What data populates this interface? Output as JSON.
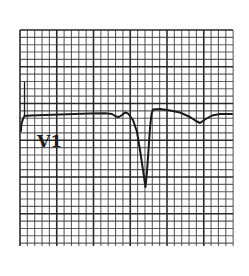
{
  "ecg": {
    "lead_label": "V1",
    "colors": {
      "background": "#ffffff",
      "grid_minor": "#3a3a3a",
      "grid_major": "#1e1e1e",
      "trace": "#1a1a1a"
    },
    "grid": {
      "left": 20,
      "top": 30,
      "right": 233,
      "bottom": 246,
      "minor_spacing": 7.35,
      "major_every": 5
    },
    "label_position": {
      "x": 37,
      "y": 133
    }
  }
}
